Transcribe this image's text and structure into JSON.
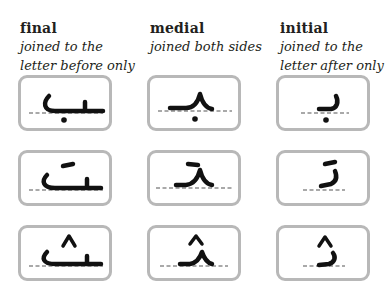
{
  "columns": [
    {
      "title": "final",
      "description_line1": "joined to the",
      "description_line2": "letter before only"
    },
    {
      "title": "medial",
      "description_line1": "joined both sides",
      "description_line2": ""
    },
    {
      "title": "initial",
      "description_line1": "joined to the",
      "description_line2": "letter after only"
    }
  ],
  "letters": [
    {
      "name": "baa",
      "forms": {
        "final": "ـب",
        "medial": "ـبـ",
        "initial": "بـ"
      },
      "dots": "one below"
    },
    {
      "name": "taa",
      "forms": {
        "final": "ـت",
        "medial": "ـتـ",
        "initial": "تـ"
      },
      "dots": "two above (written as a dash)"
    },
    {
      "name": "thaa",
      "forms": {
        "final": "ـث",
        "medial": "ـثـ",
        "initial": "ثـ"
      },
      "dots": "three above (written as a caret)"
    }
  ],
  "colors": {
    "card_border": "#b8b8b8",
    "text": "#231f20",
    "glyph": "#111111"
  }
}
